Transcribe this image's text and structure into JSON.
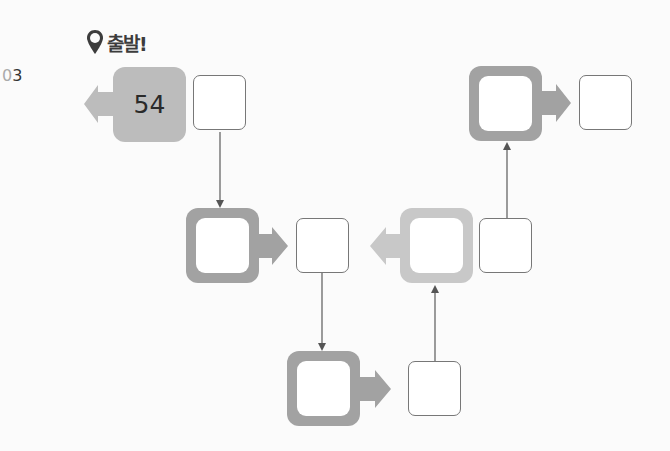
{
  "header": {
    "start_icon": "map-pin-icon",
    "start_label": "출발!",
    "problem_number_prefix": "0",
    "problem_number_digit": "3"
  },
  "colors": {
    "start_box": "#bcbcbc",
    "op_box_dark": "#a2a2a2",
    "op_box_light": "#c8c8c8",
    "arrow_dark": "#a2a2a2",
    "arrow_light": "#c8c8c8",
    "connector": "#666666"
  },
  "diagram": {
    "start": {
      "value": "54",
      "arrow_direction": "left"
    },
    "operations": [
      {
        "id": "op1",
        "arrow_direction": "right",
        "value": ""
      },
      {
        "id": "op2",
        "arrow_direction": "right",
        "value": ""
      },
      {
        "id": "op3",
        "arrow_direction": "left",
        "value": ""
      },
      {
        "id": "op4",
        "arrow_direction": "right",
        "value": ""
      }
    ],
    "answers": [
      {
        "id": "ans0",
        "value": ""
      },
      {
        "id": "ans1",
        "value": ""
      },
      {
        "id": "ans2",
        "value": ""
      },
      {
        "id": "ans3",
        "value": ""
      },
      {
        "id": "ans4",
        "value": ""
      }
    ]
  }
}
